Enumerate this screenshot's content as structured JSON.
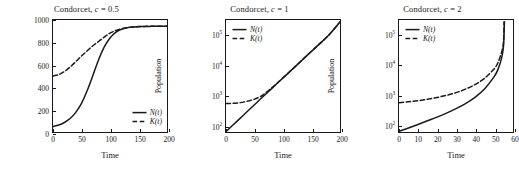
{
  "figure": {
    "width": 519,
    "height": 172,
    "background": "#ffffff",
    "line_color": "#1a1a1a"
  },
  "chart_data": [
    {
      "type": "line",
      "title": "Condorcet, c = 0.5",
      "title_prefix": "Condorcet, ",
      "title_param": "c",
      "title_value": " = 0.5",
      "xlabel": "Time",
      "ylabel": "Population",
      "xscale": "linear",
      "yscale": "linear",
      "xlim": [
        0,
        200
      ],
      "ylim": [
        0,
        1000
      ],
      "xticks": [
        0,
        50,
        100,
        150,
        200
      ],
      "xticklabels": [
        "0",
        "50",
        "100",
        "150",
        "200"
      ],
      "yticks": [
        0,
        200,
        400,
        600,
        800,
        1000
      ],
      "yticklabels": [
        "0",
        "200",
        "400",
        "600",
        "800",
        "1000"
      ],
      "grid": false,
      "legend_position": "lower-right",
      "series": [
        {
          "name": "N(t)",
          "style": "solid",
          "x": [
            0,
            10,
            20,
            30,
            40,
            50,
            60,
            70,
            80,
            90,
            100,
            110,
            120,
            130,
            140,
            150,
            160,
            170,
            180,
            190,
            200
          ],
          "values": [
            50,
            62,
            85,
            120,
            175,
            255,
            370,
            505,
            645,
            760,
            840,
            890,
            916,
            930,
            937,
            940,
            942,
            943,
            944,
            944,
            945
          ]
        },
        {
          "name": "K(t)",
          "style": "dashed",
          "x": [
            0,
            10,
            20,
            30,
            40,
            50,
            60,
            70,
            80,
            90,
            100,
            110,
            120,
            130,
            140,
            150,
            160,
            170,
            180,
            190,
            200
          ],
          "values": [
            500,
            512,
            540,
            580,
            628,
            678,
            725,
            770,
            808,
            848,
            882,
            906,
            922,
            932,
            938,
            941,
            943,
            944,
            944,
            945,
            945
          ]
        }
      ]
    },
    {
      "type": "line",
      "title": "Condorcet, c = 1",
      "title_prefix": "Condorcet, ",
      "title_param": "c",
      "title_value": " = 1",
      "xlabel": "Time",
      "ylabel": "Population",
      "xscale": "linear",
      "yscale": "log",
      "xlim": [
        0,
        200
      ],
      "ylim": [
        60,
        300000
      ],
      "xticks": [
        0,
        50,
        100,
        150,
        200
      ],
      "xticklabels": [
        "0",
        "50",
        "100",
        "150",
        "200"
      ],
      "yticks": [
        100,
        1000,
        10000,
        100000
      ],
      "yticklabels": [
        "10^2",
        "10^3",
        "10^4",
        "10^5"
      ],
      "grid": false,
      "legend_position": "upper-left",
      "series": [
        {
          "name": "N(t)",
          "style": "solid",
          "x": [
            0,
            20,
            40,
            60,
            80,
            100,
            120,
            140,
            160,
            180,
            200
          ],
          "values": [
            62,
            140,
            320,
            720,
            1620,
            3650,
            8200,
            18500,
            41500,
            93500,
            260000
          ]
        },
        {
          "name": "K(t)",
          "style": "dashed",
          "x": [
            0,
            20,
            40,
            60,
            80,
            100,
            120,
            140,
            160,
            180,
            200
          ],
          "values": [
            520,
            545,
            640,
            880,
            1700,
            3700,
            8250,
            18600,
            41600,
            93600,
            260000
          ]
        }
      ]
    },
    {
      "type": "line",
      "title": "Condorcet, c = 2",
      "title_prefix": "Condorcet, ",
      "title_param": "c",
      "title_value": " = 2",
      "xlabel": "Time",
      "ylabel": "Population",
      "xscale": "linear",
      "yscale": "log",
      "xlim": [
        0,
        60
      ],
      "ylim": [
        55,
        300000
      ],
      "xticks": [
        0,
        10,
        20,
        30,
        40,
        50,
        60
      ],
      "xticklabels": [
        "0",
        "10",
        "20",
        "30",
        "40",
        "50",
        "60"
      ],
      "yticks": [
        100,
        1000,
        10000,
        100000
      ],
      "yticklabels": [
        "10^2",
        "10^3",
        "10^4",
        "10^5"
      ],
      "grid": false,
      "legend_position": "upper-left",
      "series": [
        {
          "name": "N(t)",
          "style": "solid",
          "x": [
            0,
            5,
            10,
            15,
            20,
            25,
            30,
            35,
            40,
            45,
            50,
            52,
            54,
            55,
            55.5
          ],
          "values": [
            58,
            75,
            98,
            130,
            172,
            235,
            330,
            490,
            790,
            1500,
            3800,
            6500,
            16000,
            40000,
            260000
          ]
        },
        {
          "name": "K(t)",
          "style": "dashed",
          "x": [
            0,
            5,
            10,
            15,
            20,
            25,
            30,
            35,
            40,
            45,
            50,
            52,
            54,
            55,
            55.3
          ],
          "values": [
            520,
            560,
            610,
            680,
            780,
            920,
            1130,
            1480,
            2100,
            3400,
            7000,
            11000,
            25000,
            55000,
            260000
          ]
        }
      ]
    }
  ],
  "legend": {
    "n_label": "N(t)",
    "k_label": "K(t)",
    "n_symbol": "N",
    "k_symbol": "K",
    "arg": "(t)"
  },
  "axis_text": {
    "xlabel": "Time",
    "ylabel": "Population"
  }
}
